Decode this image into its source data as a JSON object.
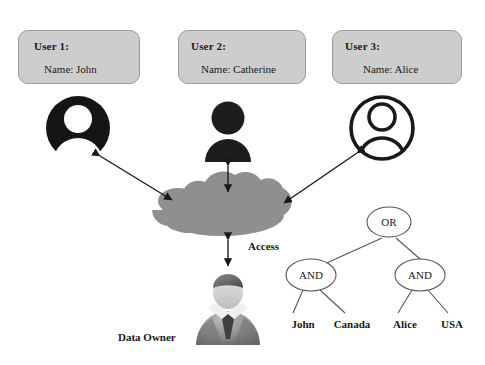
{
  "diagram": {
    "users": [
      {
        "title": "User 1:",
        "name": "Name: John",
        "avatar_icon": "user-avatar-inverted-icon"
      },
      {
        "title": "User 2:",
        "name": "Name: Catherine",
        "avatar_icon": "user-avatar-solid-icon"
      },
      {
        "title": "User 3:",
        "name": "Name: Alice",
        "avatar_icon": "user-avatar-outline-icon"
      }
    ],
    "cloud": {
      "icon": "cloud-icon",
      "label": "Access"
    },
    "data_owner": {
      "label": "Data Owner",
      "icon": "businessman-icon"
    },
    "policy_tree": {
      "root": "OR",
      "branches": [
        "AND",
        "AND"
      ],
      "leaves": [
        "John",
        "Canada",
        "Alice",
        "USA"
      ]
    },
    "connections": [
      {
        "from": "user-1-avatar",
        "to": "cloud",
        "style": "double-arrow"
      },
      {
        "from": "user-2-avatar",
        "to": "cloud",
        "style": "double-arrow"
      },
      {
        "from": "user-3-avatar",
        "to": "cloud",
        "style": "double-arrow"
      },
      {
        "from": "cloud",
        "to": "data-owner",
        "style": "double-arrow"
      }
    ]
  },
  "colors": {
    "box_fill": "#cdcdcd",
    "box_border": "#9a9a9a",
    "cloud_fill": "#8f8f8f",
    "ink": "#1a1a1a",
    "node_stroke": "#555555"
  }
}
